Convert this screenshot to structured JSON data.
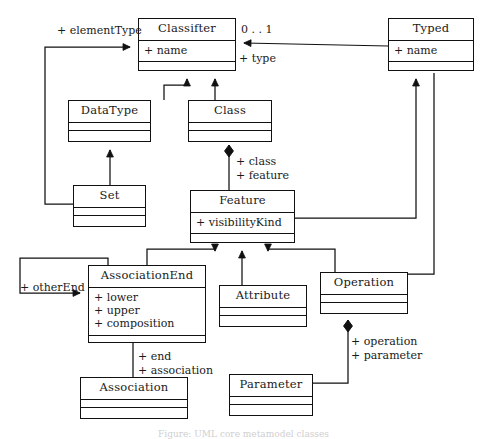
{
  "diagram": {
    "caption": "Figure: UML core metamodel classes",
    "stroke_color": "#111111",
    "background_color": "#ffffff",
    "classes": [
      {
        "id": "classifier",
        "name": "Classifter",
        "attributes": [
          "+ name"
        ],
        "operations": [],
        "x": 138,
        "y": 18,
        "w": 98,
        "h": 53
      },
      {
        "id": "typed",
        "name": "Typed",
        "attributes": [
          "+ name"
        ],
        "operations": [],
        "x": 388,
        "y": 18,
        "w": 86,
        "h": 53
      },
      {
        "id": "datatype",
        "name": "DataType",
        "attributes": [],
        "operations": [],
        "x": 68,
        "y": 100,
        "w": 83,
        "h": 42
      },
      {
        "id": "class",
        "name": "Class",
        "attributes": [],
        "operations": [],
        "x": 188,
        "y": 100,
        "w": 84,
        "h": 42
      },
      {
        "id": "set",
        "name": "Set",
        "attributes": [],
        "operations": [],
        "x": 73,
        "y": 185,
        "w": 73,
        "h": 42
      },
      {
        "id": "feature",
        "name": "Feature",
        "attributes": [
          "+ visibilityKind"
        ],
        "operations": [],
        "x": 190,
        "y": 190,
        "w": 105,
        "h": 53
      },
      {
        "id": "associationend",
        "name": "AssociationEnd",
        "attributes": [
          "+ lower",
          "+ upper",
          "+ composition"
        ],
        "operations": [],
        "x": 88,
        "y": 265,
        "w": 118,
        "h": 78
      },
      {
        "id": "attribute",
        "name": "Attribute",
        "attributes": [],
        "operations": [],
        "x": 219,
        "y": 285,
        "w": 88,
        "h": 42
      },
      {
        "id": "operation",
        "name": "Operation",
        "attributes": [],
        "operations": [],
        "x": 320,
        "y": 272,
        "w": 88,
        "h": 42
      },
      {
        "id": "association",
        "name": "Association",
        "attributes": [],
        "operations": [],
        "x": 80,
        "y": 377,
        "w": 108,
        "h": 42
      },
      {
        "id": "parameter",
        "name": "Parameter",
        "attributes": [],
        "operations": [],
        "x": 229,
        "y": 374,
        "w": 84,
        "h": 42
      }
    ],
    "edge_labels": [
      {
        "id": "element-type",
        "text": "+ elementType",
        "x": 57,
        "y": 24
      },
      {
        "id": "multiplicity-01",
        "text": "0 . . 1",
        "x": 241,
        "y": 23
      },
      {
        "id": "type-role",
        "text": "+ type",
        "x": 239,
        "y": 52
      },
      {
        "id": "class-role",
        "text": "+ class",
        "x": 236,
        "y": 155
      },
      {
        "id": "feature-role",
        "text": "+ feature",
        "x": 236,
        "y": 169
      },
      {
        "id": "other-end",
        "text": "+ otherEnd",
        "x": 20,
        "y": 281
      },
      {
        "id": "end-role",
        "text": "+ end",
        "x": 138,
        "y": 350
      },
      {
        "id": "association-role",
        "text": "+ association",
        "x": 138,
        "y": 364
      },
      {
        "id": "operation-role",
        "text": "+ operation",
        "x": 351,
        "y": 335
      },
      {
        "id": "parameter-role",
        "text": "+ parameter",
        "x": 351,
        "y": 349
      }
    ],
    "relationships": [
      {
        "id": "datatype-inherits-classifier",
        "kind": "generalization",
        "from": "DataType",
        "to": "Classifter"
      },
      {
        "id": "class-inherits-classifier",
        "kind": "generalization",
        "from": "Class",
        "to": "Classifter"
      },
      {
        "id": "set-inherits-datatype",
        "kind": "generalization",
        "from": "Set",
        "to": "DataType"
      },
      {
        "id": "set-elementtype-classifier",
        "kind": "association",
        "from": "Set",
        "to": "Classifter",
        "role": "+ elementType"
      },
      {
        "id": "typed-type-classifier",
        "kind": "association",
        "from": "Typed",
        "to": "Classifter",
        "role": "+ type",
        "multiplicity": "0 . . 1"
      },
      {
        "id": "class-owns-feature",
        "kind": "composition",
        "from": "Class",
        "to": "Feature",
        "role": "+ class / + feature"
      },
      {
        "id": "feature-inherits-typed",
        "kind": "generalization",
        "from": "Feature",
        "to": "Typed"
      },
      {
        "id": "operation-inherits-typed",
        "kind": "association",
        "from": "Operation",
        "to": "Typed"
      },
      {
        "id": "associationend-inherits-feature",
        "kind": "generalization",
        "from": "AssociationEnd",
        "to": "Feature"
      },
      {
        "id": "attribute-inherits-feature",
        "kind": "generalization",
        "from": "Attribute",
        "to": "Feature"
      },
      {
        "id": "operation-inherits-feature",
        "kind": "generalization",
        "from": "Operation",
        "to": "Feature"
      },
      {
        "id": "associationend-self-otherend",
        "kind": "association",
        "from": "AssociationEnd",
        "to": "AssociationEnd",
        "role": "+ otherEnd"
      },
      {
        "id": "associationend-association",
        "kind": "association",
        "from": "AssociationEnd",
        "to": "Association",
        "role": "+ end / + association"
      },
      {
        "id": "operation-owns-parameter",
        "kind": "composition",
        "from": "Operation",
        "to": "Parameter",
        "role": "+ operation / + parameter"
      }
    ]
  }
}
